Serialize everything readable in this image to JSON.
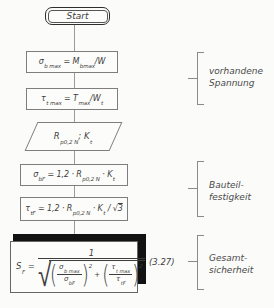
{
  "figure": {
    "title_semantic": "safety-verification-flowchart",
    "start_label": "Start",
    "steps": [
      {
        "name": "max-bending-stress",
        "formula": [
          {
            "m": "σ",
            "sub": "b max"
          },
          {
            "m": " = "
          },
          {
            "m": "M",
            "sub": "bmax"
          },
          {
            "m": "/W"
          }
        ]
      },
      {
        "name": "max-torsional-stress",
        "formula": [
          {
            "m": "τ",
            "sub": "t max"
          },
          {
            "m": " = "
          },
          {
            "m": "T",
            "sub": "max"
          },
          {
            "m": "/W",
            "sub": "t"
          }
        ]
      },
      {
        "name": "material-input",
        "formula": [
          {
            "m": "R",
            "sub": "p0,2 N"
          },
          {
            "m": "; K",
            "sub": "t"
          }
        ]
      },
      {
        "name": "bending-strength",
        "formula": [
          {
            "m": "σ",
            "sub": "bF"
          },
          {
            "m": " = 1,2 · "
          },
          {
            "m": "R",
            "sub": "p0,2 N"
          },
          {
            "m": " · "
          },
          {
            "m": "K",
            "sub": "t"
          }
        ]
      },
      {
        "name": "torsional-strength",
        "formula": [
          {
            "m": "τ",
            "sub": "tF"
          },
          {
            "m": " = 1,2 · "
          },
          {
            "m": "R",
            "sub": "p0,2 N"
          },
          {
            "m": " · "
          },
          {
            "m": "K",
            "sub": "t"
          },
          {
            "m": " / √"
          },
          {
            "m": "3",
            "ov": true
          }
        ]
      }
    ],
    "result": {
      "lhs": [
        {
          "m": "S",
          "sub": "F"
        },
        {
          "m": " ="
        }
      ],
      "numerator": "1",
      "radical": "√",
      "paren_open": "(",
      "paren_close": ")",
      "plus": "+",
      "term1": {
        "num": [
          {
            "m": "σ",
            "sub": "b max"
          }
        ],
        "den": [
          {
            "m": "σ",
            "sub": "bF"
          }
        ],
        "exp": "2"
      },
      "term2": {
        "num": [
          {
            "m": "τ",
            "sub": "t max"
          }
        ],
        "den": [
          {
            "m": "τ",
            "sub": "tF"
          }
        ],
        "exp": "2"
      },
      "eq_number": "(3.27)"
    },
    "annotations": [
      {
        "name": "existing-stress",
        "lines": [
          "vorhandene",
          "Spannung"
        ]
      },
      {
        "name": "component-strength",
        "lines": [
          "Bauteil-",
          "festigkeit"
        ]
      },
      {
        "name": "overall-safety",
        "lines": [
          "Gesamt-",
          "sicherheit"
        ]
      }
    ],
    "colors": {
      "paper": "#fbfbf9",
      "ink": "#3d3d3d",
      "box_border": "#7e7e7e",
      "shadow": "#121212",
      "bracket": "#8a8a8a"
    }
  }
}
